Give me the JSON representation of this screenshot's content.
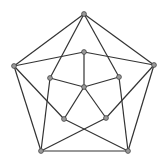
{
  "diagram": {
    "type": "graph",
    "colors": {
      "edge": "#333333",
      "node_fill": "#9a9a9a",
      "node_stroke": "#444444",
      "background": "#ffffff"
    },
    "nodes": [
      {
        "id": "A",
        "x": 84,
        "y": 14
      },
      {
        "id": "B",
        "x": 14,
        "y": 66
      },
      {
        "id": "C",
        "x": 154,
        "y": 65
      },
      {
        "id": "D",
        "x": 41,
        "y": 151
      },
      {
        "id": "E",
        "x": 128,
        "y": 151
      },
      {
        "id": "F",
        "x": 84,
        "y": 52
      },
      {
        "id": "G",
        "x": 50,
        "y": 78
      },
      {
        "id": "H",
        "x": 119,
        "y": 77
      },
      {
        "id": "I",
        "x": 84,
        "y": 87
      },
      {
        "id": "J",
        "x": 64,
        "y": 119
      },
      {
        "id": "K",
        "x": 106,
        "y": 118
      }
    ],
    "edges": [
      [
        "A",
        "B"
      ],
      [
        "A",
        "C"
      ],
      [
        "A",
        "G"
      ],
      [
        "A",
        "H"
      ],
      [
        "B",
        "F"
      ],
      [
        "C",
        "F"
      ],
      [
        "F",
        "I"
      ],
      [
        "G",
        "I"
      ],
      [
        "H",
        "I"
      ],
      [
        "I",
        "J"
      ],
      [
        "I",
        "K"
      ],
      [
        "B",
        "D"
      ],
      [
        "B",
        "J"
      ],
      [
        "C",
        "E"
      ],
      [
        "C",
        "K"
      ],
      [
        "G",
        "D"
      ],
      [
        "H",
        "E"
      ],
      [
        "J",
        "E"
      ],
      [
        "K",
        "D"
      ],
      [
        "D",
        "E"
      ]
    ]
  }
}
